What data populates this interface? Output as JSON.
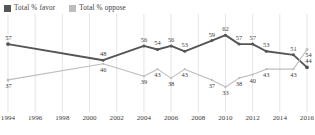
{
  "legend": {
    "position": "top-left",
    "entries": [
      {
        "label": "Total % favor",
        "color": "#555555",
        "icon": "square-swatch"
      },
      {
        "label": "Total % oppose",
        "color": "#bdbdbd",
        "icon": "square-swatch"
      }
    ]
  },
  "colors": {
    "favor": "#555555",
    "oppose": "#bdbdbd",
    "gridline": "#d9d9d9",
    "text": "#3b3b3b",
    "background": "#ffffff"
  },
  "chart_data": {
    "type": "line",
    "title": "",
    "subtitle": "",
    "xlabel": "",
    "ylabel": "",
    "grid": "vertical-only",
    "legend_position": "top-left",
    "xlim": [
      1994,
      2016
    ],
    "ylim": [
      28,
      66
    ],
    "xticks": [
      "1994",
      "1996",
      "1998",
      "2000",
      "2002",
      "2004",
      "2006",
      "2008",
      "2010",
      "2012",
      "2014",
      "2016"
    ],
    "yticks": [],
    "x": [
      1994,
      2001,
      2004,
      2005,
      2006,
      2007,
      2009,
      2010,
      2011,
      2012,
      2013,
      2015,
      2016
    ],
    "series": [
      {
        "name": "Total % favor",
        "color": "#555555",
        "values": [
          57,
          48,
          56,
          54,
          56,
          53,
          59,
          62,
          57,
          57,
          53,
          51,
          44
        ],
        "label_position": "above"
      },
      {
        "name": "Total % oppose",
        "color": "#bdbdbd",
        "values": [
          37,
          46,
          39,
          43,
          38,
          43,
          37,
          33,
          38,
          40,
          43,
          43,
          54
        ],
        "label_position": "below"
      }
    ]
  }
}
